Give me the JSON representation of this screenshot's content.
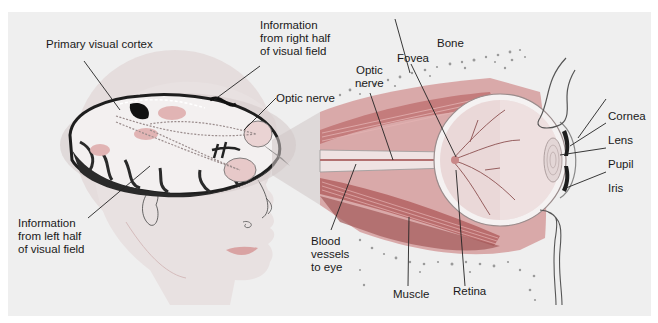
{
  "figure": {
    "title_cropped": "",
    "colors": {
      "panel_bg": "#efefef",
      "head_skin": "#e6dede",
      "head_halo": "#e4dcdc",
      "brain_light": "#f2efef",
      "brain_pink": "#e3b8b8",
      "brain_dark": "#222222",
      "eye_socket_muscle": "#c98080",
      "eye_muscle_dark": "#9e4e4e",
      "sclera": "#f4f1f1",
      "eyeball_interior": "#e9d8d8",
      "lens": "#d9c8c8",
      "iris": "#1e1e1e",
      "bone_dots": "#9a9a9a",
      "leader_line": "#222222"
    }
  },
  "labels": {
    "primary_visual_cortex": "Primary visual cortex",
    "info_right_half": "Information\nfrom right half\nof visual field",
    "optic_nerve_brain": "Optic nerve",
    "info_left_half": "Information\nfrom left half\nof visual field",
    "bone": "Bone",
    "fovea": "Fovea",
    "optic_nerve_eye": "Optic\nnerve",
    "cornea": "Cornea",
    "lens": "Lens",
    "pupil": "Pupil",
    "iris": "Iris",
    "blood_vessels": "Blood\nvessels\nto eye",
    "muscle": "Muscle",
    "retina": "Retina"
  }
}
